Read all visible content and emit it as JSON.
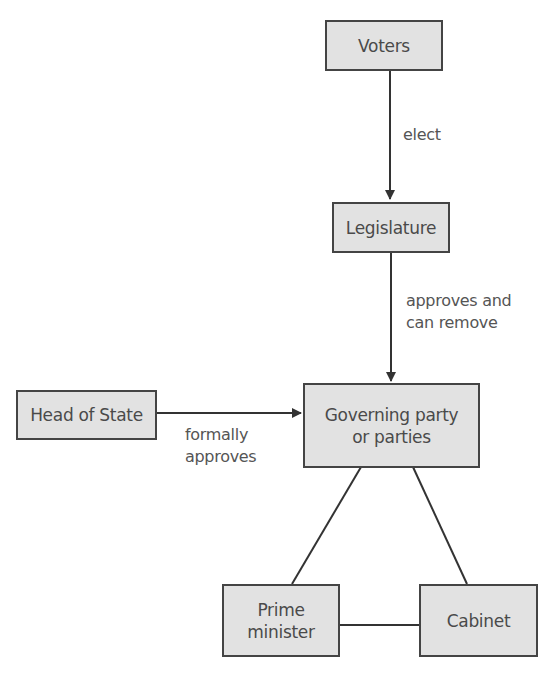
{
  "figure": {
    "title_partial": "Figure — Parliamentary system of government"
  },
  "nodes": {
    "voters": "Voters",
    "legislature": "Legislature",
    "head_of_state": "Head of State",
    "governing": {
      "line1": "Governing party",
      "line2": "or parties"
    },
    "prime_minister": {
      "line1": "Prime",
      "line2": "minister"
    },
    "cabinet": "Cabinet"
  },
  "edges": {
    "voters_to_legislature": "elect",
    "legislature_to_governing": {
      "line1": "approves and",
      "line2": "can remove"
    },
    "head_to_governing": {
      "line1": "formally",
      "line2": "approves"
    }
  },
  "colors": {
    "box_fill": "#e2e2e2",
    "box_border": "#444444",
    "text": "#4a4a4a",
    "line": "#333333"
  }
}
